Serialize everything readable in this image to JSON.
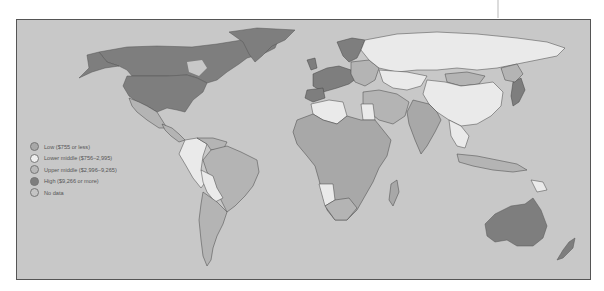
{
  "map": {
    "title": "World income groups",
    "colors": {
      "ocean": "#c8c8c8",
      "low": "#a8a8a8",
      "lower_middle": "#eaeaea",
      "upper_middle": "#b4b4b4",
      "high": "#7e7e7e",
      "no_data": "#c4c4c4",
      "border": "#444444"
    }
  },
  "legend": {
    "items": [
      {
        "label": "Low ($755 or less)",
        "color": "#a8a8a8"
      },
      {
        "label": "Lower middle ($756–2,995)",
        "color": "#eeeeee"
      },
      {
        "label": "Upper middle ($2,996–9,265)",
        "color": "#b8b8b8"
      },
      {
        "label": "High ($9,266 or more)",
        "color": "#7e7e7e"
      },
      {
        "label": "No data",
        "color": "#c4c4c4"
      }
    ]
  }
}
